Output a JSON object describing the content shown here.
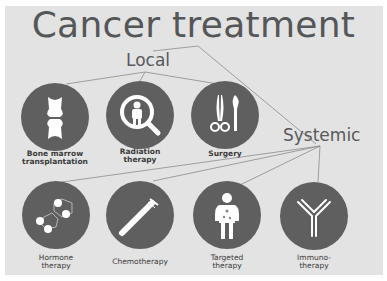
{
  "title": "Cancer treatment",
  "categories": {
    "local": "Local",
    "systemic": "Systemic"
  },
  "local_treatments": [
    {
      "label_line1": "Bone marrow",
      "label_line2": "transplantation",
      "icon": "bone-joint-icon"
    },
    {
      "label_line1": "Radiation",
      "label_line2": "therapy",
      "icon": "magnifier-person-icon"
    },
    {
      "label_line1": "Surgery",
      "label_line2": "",
      "icon": "scissors-scalpel-icon"
    }
  ],
  "systemic_treatments": [
    {
      "label_line1": "Hormone",
      "label_line2": "therapy",
      "icon": "molecule-icon"
    },
    {
      "label_line1": "Chemotherapy",
      "label_line2": "",
      "icon": "test-tube-icon"
    },
    {
      "label_line1": "Targeted",
      "label_line2": "therapy",
      "icon": "body-target-icon"
    },
    {
      "label_line1": "Immuno-",
      "label_line2": "therapy",
      "icon": "antibody-icon"
    }
  ],
  "colors": {
    "background": "#e3e3e3",
    "circle": "#5f5f60",
    "text": "#555658",
    "lines": "#8a8a8a"
  }
}
